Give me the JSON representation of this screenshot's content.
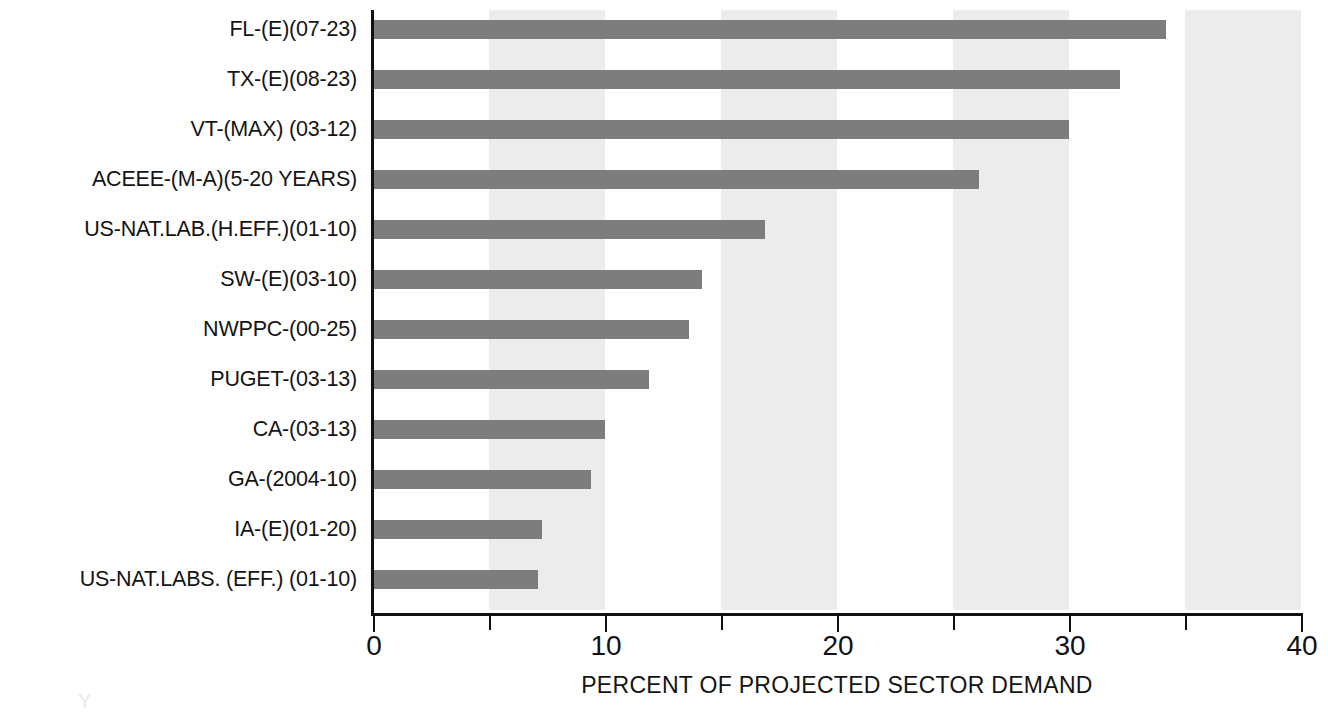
{
  "chart_data": {
    "type": "bar",
    "orientation": "horizontal",
    "title": "",
    "subtitle": "",
    "xlabel": "PERCENT OF PROJECTED SECTOR DEMAND",
    "ylabel": "",
    "xlim": [
      0,
      40
    ],
    "xticks": [
      0,
      5,
      10,
      15,
      20,
      25,
      30,
      35,
      40
    ],
    "xtick_labels": [
      "0",
      "",
      "10",
      "",
      "20",
      "",
      "30",
      "",
      "40"
    ],
    "grid": false,
    "shaded_bands": [
      [
        5,
        10
      ],
      [
        15,
        20
      ],
      [
        25,
        30
      ],
      [
        35,
        40
      ]
    ],
    "legend": null,
    "bar_color": "#7d7d7d",
    "band_color": "#ececec",
    "axis_color": "#111111",
    "categories": [
      "FL-(E)(07-23)",
      "TX-(E)(08-23)",
      "VT-(MAX) (03-12)",
      "ACEEE-(M-A)(5-20 YEARS)",
      "US-NAT.LAB.(H.EFF.)(01-10)",
      "SW-(E)(03-10)",
      "NWPPC-(00-25)",
      "PUGET-(03-13)",
      "CA-(03-13)",
      "GA-(2004-10)",
      "IA-(E)(01-20)",
      "US-NAT.LABS. (EFF.) (01-10)"
    ],
    "values": [
      34.2,
      32.2,
      30.0,
      26.1,
      16.9,
      14.2,
      13.6,
      11.9,
      10.0,
      9.4,
      7.3,
      7.1
    ]
  },
  "artifact": {
    "mark": "Y"
  }
}
